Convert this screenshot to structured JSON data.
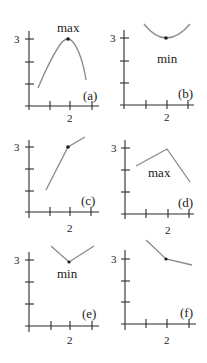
{
  "figure": {
    "panels": [
      {
        "id": "a",
        "label": "(a)",
        "annotation": "max",
        "y_tick_label": "3",
        "x_tick_label": "2",
        "shape": "smooth curve with maximum at x=2, y=3"
      },
      {
        "id": "b",
        "label": "(b)",
        "annotation": "min",
        "y_tick_label": "3",
        "x_tick_label": "2",
        "shape": "smooth curve with minimum at x=2, y=3"
      },
      {
        "id": "c",
        "label": "(c)",
        "annotation": "",
        "y_tick_label": "3",
        "x_tick_label": "2",
        "shape": "increasing piecewise line with corner at x=2, y=3"
      },
      {
        "id": "d",
        "label": "(d)",
        "annotation": "max",
        "y_tick_label": "3",
        "x_tick_label": "2",
        "shape": "piecewise line with corner maximum at x=2, y=3"
      },
      {
        "id": "e",
        "label": "(e)",
        "annotation": "min",
        "y_tick_label": "3",
        "x_tick_label": "2",
        "shape": "V-shaped piecewise line with corner minimum at x=2, y=3"
      },
      {
        "id": "f",
        "label": "(f)",
        "annotation": "",
        "y_tick_label": "3",
        "x_tick_label": "2",
        "shape": "decreasing piecewise line with corner at x=2, y=3"
      }
    ]
  },
  "colors": {
    "axis": "#2b2b2b",
    "curve": "#8a8a8a",
    "point": "#1a1a1a"
  }
}
